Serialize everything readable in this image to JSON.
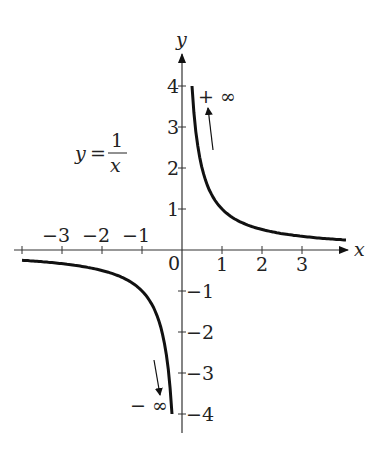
{
  "chart_data": {
    "type": "line",
    "formula": {
      "lhs": "y",
      "eq": "=",
      "numerator": "1",
      "denominator": "x"
    },
    "xlabel": "x",
    "ylabel": "y",
    "xlim": [
      -4,
      4
    ],
    "ylim": [
      -4,
      4
    ],
    "x_ticks": [
      {
        "v": -3,
        "label": "−3"
      },
      {
        "v": -2,
        "label": "−2"
      },
      {
        "v": -1,
        "label": "−1"
      },
      {
        "v": 1,
        "label": "1"
      },
      {
        "v": 2,
        "label": "2"
      },
      {
        "v": 3,
        "label": "3"
      }
    ],
    "y_ticks": [
      {
        "v": 4,
        "label": "4"
      },
      {
        "v": 3,
        "label": "3"
      },
      {
        "v": 2,
        "label": "2"
      },
      {
        "v": 1,
        "label": "1"
      },
      {
        "v": -1,
        "label": "−1"
      },
      {
        "v": -2,
        "label": "−2"
      },
      {
        "v": -3,
        "label": "−3"
      },
      {
        "v": -4,
        "label": "−4"
      }
    ],
    "origin_label": "0",
    "series": [
      {
        "name": "positive branch",
        "x": [
          0.25,
          0.5,
          1,
          2,
          3,
          4
        ],
        "y": [
          4,
          2,
          1,
          0.5,
          0.333,
          0.25
        ]
      },
      {
        "name": "negative branch",
        "x": [
          -4,
          -3,
          -2,
          -1,
          -0.5,
          -0.25
        ],
        "y": [
          -0.25,
          -0.333,
          -0.5,
          -1,
          -2,
          -4
        ]
      }
    ],
    "annotations": [
      {
        "text": "+ ∞",
        "near": "positive branch top, arrow pointing up"
      },
      {
        "text": "− ∞",
        "near": "negative branch bottom, arrow pointing down"
      }
    ],
    "grid": false,
    "legend": "none"
  }
}
